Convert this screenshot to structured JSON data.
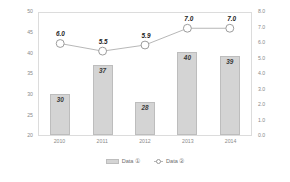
{
  "chart_data": {
    "type": "bar",
    "title": "",
    "subtitle": "",
    "xlabel": "",
    "ylabel": "",
    "categories": [
      "2010",
      "2011",
      "2012",
      "2013",
      "2014"
    ],
    "series": [
      {
        "name": "Data ①",
        "type": "bar",
        "axis": "left",
        "values": [
          30,
          37,
          28,
          40,
          39
        ],
        "labels": [
          "30",
          "37",
          "28",
          "40",
          "39"
        ],
        "color": "#d4d4d4",
        "border_color": "#bdbdbd"
      },
      {
        "name": "Data ②",
        "type": "line",
        "axis": "right",
        "values": [
          6.0,
          5.5,
          5.9,
          7.0,
          7.0
        ],
        "labels": [
          "6.0",
          "5.5",
          "5.9",
          "7.0",
          "7.0"
        ],
        "color": "#b6b6b6",
        "marker": "open-circle",
        "marker_fill": "#ffffff",
        "marker_border": "#9a9a9a"
      }
    ],
    "left_axis": {
      "ticks": [
        "50",
        "45",
        "40",
        "35",
        "30",
        "25",
        "20"
      ],
      "ylim": [
        20,
        50
      ],
      "step": 5
    },
    "right_axis": {
      "ticks": [
        "8.0",
        "7.0",
        "6.0",
        "5.0",
        "4.0",
        "3.0",
        "2.0",
        "1.0",
        "0.0"
      ],
      "ylim": [
        0,
        8
      ],
      "step": 1
    },
    "grid": false,
    "legend_position": "bottom",
    "frame_color": "#dcdcdc"
  },
  "legend": {
    "items": [
      {
        "label": "Data ①"
      },
      {
        "label": "Data ②"
      }
    ]
  }
}
